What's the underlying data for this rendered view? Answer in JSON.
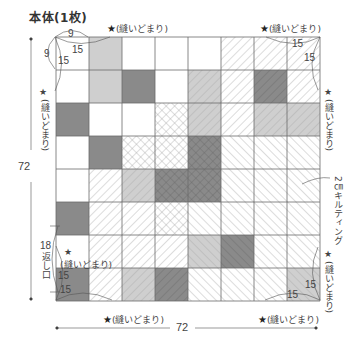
{
  "title": "本体(1枚)",
  "dimensions": {
    "width": "72",
    "height": "72"
  },
  "corner_dims": {
    "top_left_h": "9",
    "top_left_v": "9",
    "top_left_diag_h": "15",
    "top_left_diag_v": "15",
    "top_right_h": "15",
    "top_right_v": "15",
    "bottom_left_h": "15",
    "bottom_left_v": "15",
    "bottom_right_h": "15",
    "bottom_right_v": "15"
  },
  "stitch_stop_label": "(縫いどまり)",
  "star": "★",
  "opening": {
    "size": "18",
    "label": "返し口"
  },
  "quilting_label": "2㎝キルティング",
  "grid": {
    "rows": 8,
    "cols": 8,
    "cells": [
      [
        "w",
        "l",
        "w",
        "w",
        "w",
        "h",
        "h",
        "h"
      ],
      [
        "w",
        "l",
        "d",
        "w",
        "lh",
        "h",
        "dh",
        "h"
      ],
      [
        "d",
        "w",
        "w",
        "x",
        "lh",
        "h",
        "lh",
        "lh"
      ],
      [
        "w",
        "d",
        "x",
        "x",
        "dx",
        "b",
        "b",
        "b"
      ],
      [
        "w",
        "h",
        "lh",
        "dx",
        "dx",
        "b",
        "b",
        "b"
      ],
      [
        "d",
        "h",
        "h",
        "x",
        "b",
        "b",
        "b",
        "b"
      ],
      [
        "w",
        "h",
        "h",
        "h",
        "lb",
        "db",
        "b",
        "b"
      ],
      [
        "d",
        "h",
        "lh",
        "dh",
        "b",
        "b",
        "b",
        "lb"
      ]
    ]
  },
  "colors": {
    "dark": "#8a8a8a",
    "light": "#cfcfcf",
    "line": "#6a6a6a",
    "hatch": "#b0b0b0"
  }
}
